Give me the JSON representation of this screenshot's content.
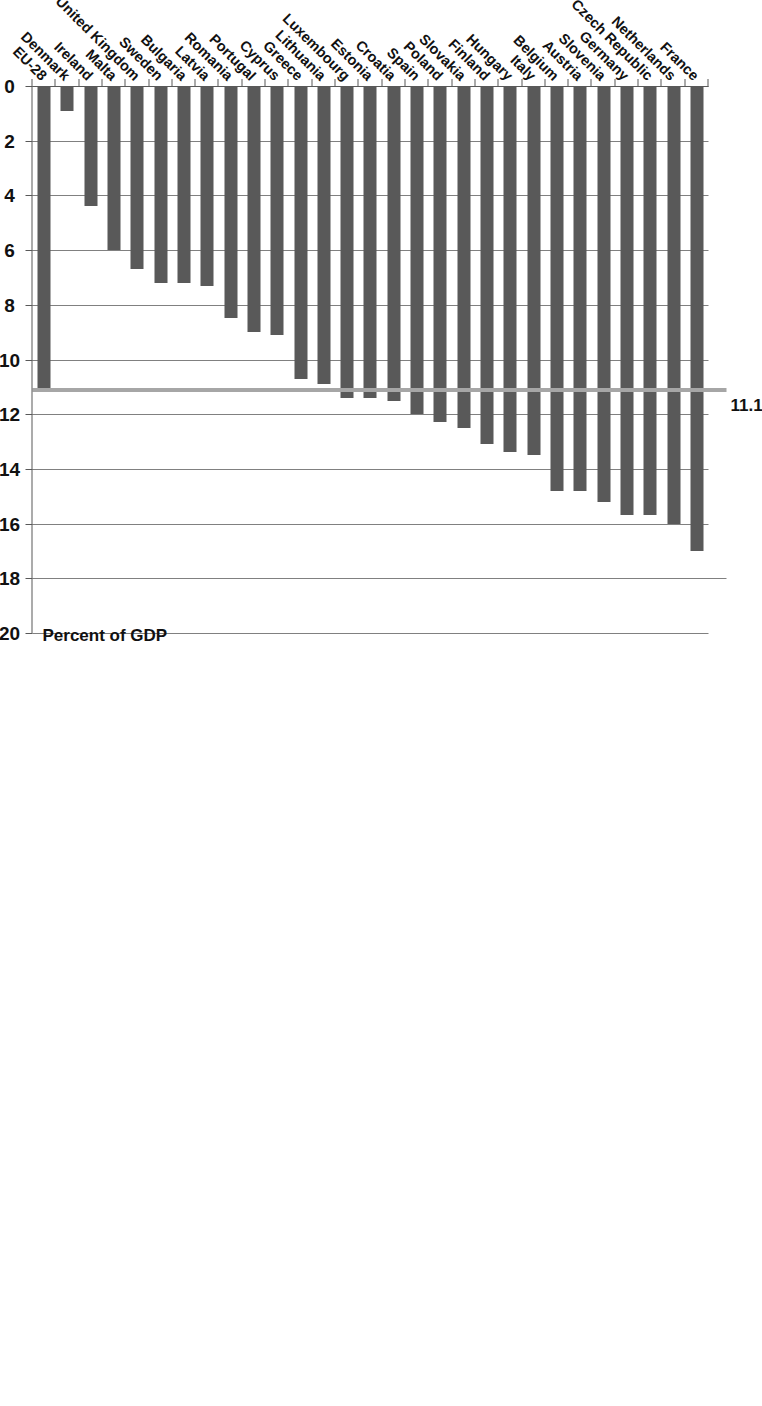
{
  "chart_data": {
    "type": "bar",
    "orientation": "horizontal",
    "title": "",
    "xlabel": "Percent of GDP",
    "ylabel": "",
    "xlim": [
      0,
      20
    ],
    "xticks": [
      0,
      2,
      4,
      6,
      8,
      10,
      12,
      14,
      16,
      18,
      20
    ],
    "xtick_labels": [
      "0",
      "2",
      "4",
      "6",
      "8",
      "10",
      "12",
      "14",
      "16",
      "18",
      "20"
    ],
    "grid": true,
    "grid_axis": "x",
    "legend": "none",
    "bar_color": "#595959",
    "reference_line": {
      "label": "11.1",
      "value": 11.1,
      "color": "#a6a6a6",
      "series": "EU-28"
    },
    "categories": [
      "France",
      "Netherlands",
      "Czech Republic",
      "Germany",
      "Slovenia",
      "Austria",
      "Belgium",
      "Italy",
      "Hungary",
      "Finland",
      "Slovakia",
      "Poland",
      "Spain",
      "Croatia",
      "Estonia",
      "Luxembourg",
      "Lithuania",
      "Greece",
      "Cyprus",
      "Portugal",
      "Romania",
      "Latvia",
      "Bulgaria",
      "Sweden",
      "United Kingdom",
      "Malta",
      "Ireland",
      "Denmark",
      "EU-28"
    ],
    "values": [
      17.0,
      16.0,
      15.7,
      15.7,
      15.2,
      14.8,
      14.8,
      13.5,
      13.4,
      13.1,
      12.5,
      12.3,
      12.0,
      11.5,
      11.4,
      11.4,
      10.9,
      10.7,
      9.1,
      9.0,
      8.5,
      7.3,
      7.2,
      7.2,
      6.7,
      6.0,
      4.4,
      0.9,
      11.1
    ]
  },
  "axis_title": "Percent of GDP"
}
